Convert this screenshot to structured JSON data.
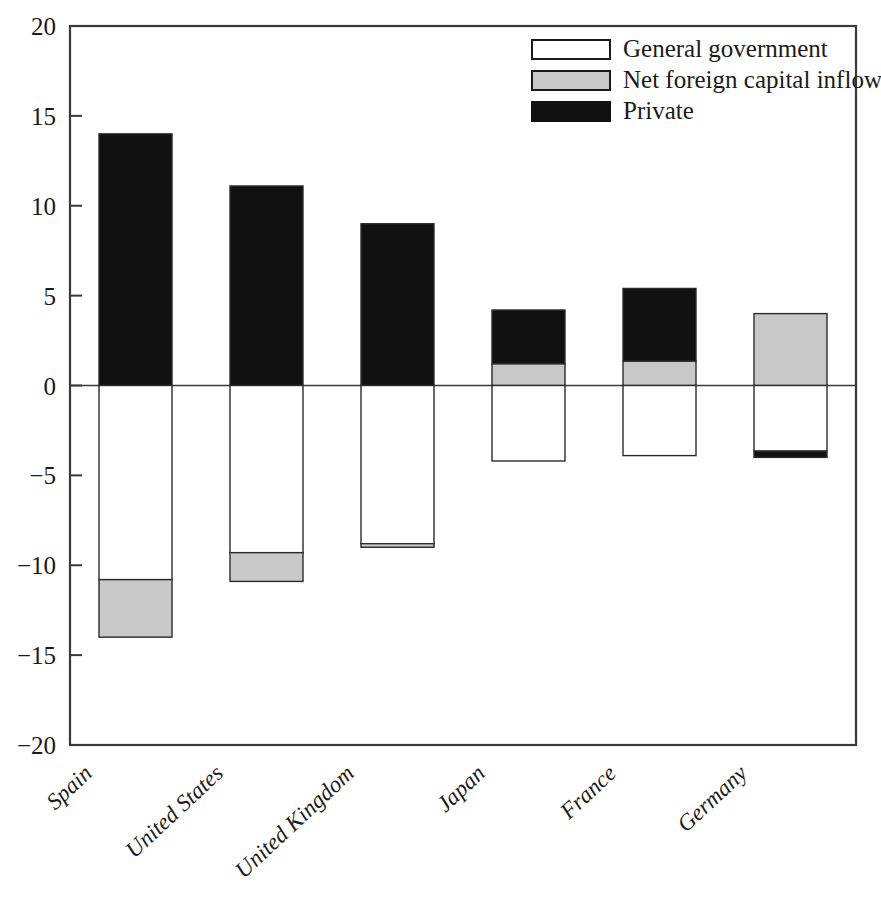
{
  "chart_data": {
    "type": "bar",
    "subtype": "stacked-diverging",
    "title": "",
    "subtitle": "",
    "xlabel": "",
    "ylabel": "",
    "categories": [
      "Spain",
      "United States",
      "United Kingdom",
      "Japan",
      "France",
      "Germany"
    ],
    "series": [
      {
        "name": "General government",
        "color": "#ffffff",
        "values": [
          -10.8,
          -9.3,
          -8.8,
          -4.2,
          -3.9,
          -3.65
        ]
      },
      {
        "name": "Net foreign capital inflow",
        "color": "#c8c8c8",
        "values": [
          -3.2,
          -1.6,
          -0.2,
          1.2,
          1.35,
          4.0
        ]
      },
      {
        "name": "Private",
        "color": "#111111",
        "values": [
          14.0,
          11.1,
          9.0,
          3.0,
          4.05,
          -0.35
        ]
      }
    ],
    "stacks": [
      {
        "category": "Spain",
        "segments": [
          {
            "series": "Private",
            "from": 0.0,
            "to": 14.0
          },
          {
            "series": "General government",
            "from": 0.0,
            "to": -10.8
          },
          {
            "series": "Net foreign capital inflow",
            "from": -10.8,
            "to": -14.0
          }
        ]
      },
      {
        "category": "United States",
        "segments": [
          {
            "series": "Private",
            "from": 0.0,
            "to": 11.1
          },
          {
            "series": "General government",
            "from": 0.0,
            "to": -9.3
          },
          {
            "series": "Net foreign capital inflow",
            "from": -9.3,
            "to": -10.9
          }
        ]
      },
      {
        "category": "United Kingdom",
        "segments": [
          {
            "series": "Private",
            "from": 0.0,
            "to": 9.0
          },
          {
            "series": "General government",
            "from": 0.0,
            "to": -8.8
          },
          {
            "series": "Net foreign capital inflow",
            "from": -8.8,
            "to": -9.0
          }
        ]
      },
      {
        "category": "Japan",
        "segments": [
          {
            "series": "Private",
            "from": 1.2,
            "to": 4.2
          },
          {
            "series": "Net foreign capital inflow",
            "from": 0.0,
            "to": 1.2
          },
          {
            "series": "General government",
            "from": 0.0,
            "to": -4.2
          }
        ]
      },
      {
        "category": "France",
        "segments": [
          {
            "series": "Private",
            "from": 1.35,
            "to": 5.4
          },
          {
            "series": "Net foreign capital inflow",
            "from": 0.0,
            "to": 1.35
          },
          {
            "series": "General government",
            "from": 0.0,
            "to": -3.9
          }
        ]
      },
      {
        "category": "Germany",
        "segments": [
          {
            "series": "Net foreign capital inflow",
            "from": 0.0,
            "to": 4.0
          },
          {
            "series": "General government",
            "from": 0.0,
            "to": -3.65
          },
          {
            "series": "Private",
            "from": -3.65,
            "to": -4.0
          }
        ]
      }
    ],
    "yaxis": {
      "min": -20,
      "max": 20,
      "tick_step": 5,
      "ticks": [
        20,
        15,
        10,
        5,
        0,
        -5,
        -10,
        -15,
        -20
      ],
      "tick_labels": [
        "20",
        "15",
        "10",
        "5",
        "0",
        "−5",
        "−10",
        "−15",
        "−20"
      ]
    },
    "grid": false,
    "zero_line": true,
    "legend": {
      "position": "top-right",
      "entries": [
        {
          "label": "General government",
          "color": "#ffffff",
          "border": "#1a1a1a"
        },
        {
          "label": "Net foreign capital inflow",
          "color": "#c8c8c8",
          "border": "#1a1a1a"
        },
        {
          "label": "Private",
          "color": "#111111",
          "border": "#111111"
        }
      ]
    }
  },
  "colors": {
    "frame": "#3a3a3a",
    "axis_text": "#1a1a1a",
    "general_government": "#ffffff",
    "net_foreign_capital_inflow": "#c8c8c8",
    "private": "#111111",
    "background": "#ffffff"
  }
}
